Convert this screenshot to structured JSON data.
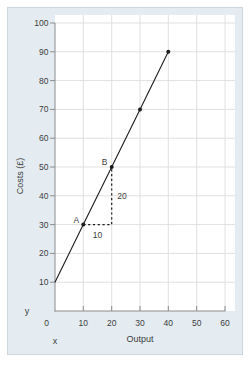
{
  "chart_data": {
    "type": "line",
    "title": "",
    "xlabel": "Output",
    "ylabel": "Costs (£)",
    "x_axis_letter": "x",
    "y_axis_letter": "y",
    "xlim": [
      0,
      60
    ],
    "ylim": [
      0,
      100
    ],
    "x_ticks": [
      0,
      10,
      20,
      30,
      40,
      50,
      60
    ],
    "y_ticks": [
      10,
      20,
      30,
      40,
      50,
      60,
      70,
      80,
      90,
      100
    ],
    "grid": true,
    "series": [
      {
        "name": "total-costs-line",
        "x": [
          0,
          10,
          20,
          30,
          40
        ],
        "y": [
          10,
          30,
          50,
          70,
          90
        ]
      }
    ],
    "markers": [
      {
        "x": 10,
        "y": 30,
        "label": "A"
      },
      {
        "x": 20,
        "y": 50,
        "label": "B"
      },
      {
        "x": 30,
        "y": 70,
        "label": ""
      },
      {
        "x": 40,
        "y": 90,
        "label": ""
      }
    ],
    "annotation": {
      "run": {
        "from": [
          10,
          30
        ],
        "to": [
          20,
          30
        ],
        "label": "10"
      },
      "rise": {
        "from": [
          20,
          30
        ],
        "to": [
          20,
          50
        ],
        "label": "20"
      }
    },
    "colors": {
      "panel_bg": "#e4ecf1",
      "panel_border": "#ccd8e0",
      "plot_bg": "#ffffff",
      "grid": "#e0e0e0",
      "axis": "#8c8c8c",
      "line": "#1c1c1c",
      "text": "#3d3d3d"
    }
  }
}
